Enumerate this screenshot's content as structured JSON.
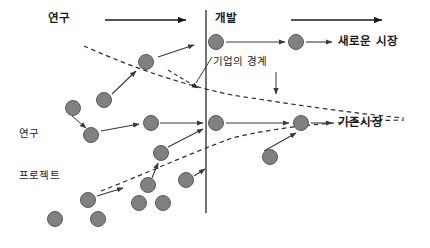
{
  "diagram": {
    "type": "process-flow",
    "canvas": {
      "width": 430,
      "height": 248,
      "background": "#ffffff"
    },
    "colors": {
      "node_fill": "#808080",
      "node_stroke": "#5a5a5a",
      "line": "#3a3a3a",
      "dashed": "#2b2b2b",
      "text": "#1a1a1a",
      "boundary_line": "#3a3a3a"
    }
  },
  "labels": {
    "stage_research": "연구",
    "stage_development": "개발",
    "boundary": "기업의 경계",
    "project_line1": "연구",
    "project_line2": "프로젝트",
    "market_new": "새로운 시장",
    "market_existing": "기존시장"
  },
  "label_positions": {
    "stage_research": {
      "x": 48,
      "y": 13
    },
    "stage_development": {
      "x": 215,
      "y": 13
    },
    "boundary": {
      "x": 213,
      "y": 62
    },
    "project": {
      "x": 19,
      "y": 100
    },
    "market_new": {
      "x": 338,
      "y": 36
    },
    "market_existing": {
      "x": 338,
      "y": 111
    }
  },
  "boundary_line": {
    "x": 206,
    "y1": 10,
    "y2": 213
  },
  "stage_arrows": [
    {
      "name": "research-arrow",
      "x1": 105,
      "y1": 20,
      "x2": 188,
      "y2": 20
    },
    {
      "name": "development-arrow",
      "x1": 291,
      "y1": 20,
      "x2": 384,
      "y2": 20
    }
  ],
  "dashed_curves": [
    {
      "name": "upper-boundary-curve",
      "path": "M 84 46 C 120 62, 170 82, 232 95 C 290 104, 350 113, 404 118"
    },
    {
      "name": "lower-boundary-curve",
      "path": "M 101 191 C 140 176, 186 155, 232 138 C 290 124, 352 121, 404 120"
    }
  ],
  "boundary_pointer": {
    "name": "boundary-callout-arrow",
    "x1": 276,
    "y1": 72,
    "x2": 276,
    "y2": 96
  },
  "boundary_leader": {
    "name": "boundary-leader-line",
    "x1": 212,
    "y1": 57,
    "x2": 196,
    "y2": 83
  },
  "nodes": [
    {
      "id": "n1",
      "name": "project-node-upper-mid",
      "cx": 146,
      "cy": 62,
      "r": 7.5
    },
    {
      "id": "n2",
      "name": "project-node-left-upper",
      "cx": 104,
      "cy": 100,
      "r": 7.5
    },
    {
      "id": "n3",
      "name": "project-node-left-mid",
      "cx": 73,
      "cy": 108,
      "r": 7.5
    },
    {
      "id": "n4",
      "name": "project-node-left-lower",
      "cx": 91,
      "cy": 135,
      "r": 7.5
    },
    {
      "id": "n5",
      "name": "project-node-center-row",
      "cx": 151,
      "cy": 123,
      "r": 7.5
    },
    {
      "id": "n6",
      "name": "project-node-boundary-upper",
      "cx": 216,
      "cy": 123,
      "r": 7.5
    },
    {
      "id": "n7",
      "name": "market-node-existing",
      "cx": 301,
      "cy": 123,
      "r": 7.5
    },
    {
      "id": "n8",
      "name": "project-node-dev-top",
      "cx": 216,
      "cy": 42,
      "r": 7.5
    },
    {
      "id": "n9",
      "name": "market-node-new",
      "cx": 296,
      "cy": 42,
      "r": 7.5
    },
    {
      "id": "n10",
      "name": "project-node-below-boundary",
      "cx": 270,
      "cy": 157,
      "r": 7.5
    },
    {
      "id": "n11",
      "name": "project-node-funnel-mid",
      "cx": 161,
      "cy": 153,
      "r": 7.5
    },
    {
      "id": "n12",
      "name": "project-node-lower-a",
      "cx": 148,
      "cy": 185,
      "r": 7.5
    },
    {
      "id": "n13",
      "name": "project-node-lower-b",
      "cx": 186,
      "cy": 180,
      "r": 7.5
    },
    {
      "id": "n14",
      "name": "project-node-lower-c",
      "cx": 139,
      "cy": 203,
      "r": 7.5
    },
    {
      "id": "n15",
      "name": "project-node-lower-d",
      "cx": 163,
      "cy": 203,
      "r": 7.5
    },
    {
      "id": "n16",
      "name": "project-node-bottom-left",
      "cx": 88,
      "cy": 200,
      "r": 7.5
    },
    {
      "id": "n17",
      "name": "project-node-bottom-a",
      "cx": 55,
      "cy": 219,
      "r": 7.5
    },
    {
      "id": "n18",
      "name": "project-node-bottom-b",
      "cx": 98,
      "cy": 219,
      "r": 7.5
    }
  ],
  "connector_arrows": [
    {
      "name": "arrow-node1-to-boundary-up",
      "x1": 158,
      "y1": 57,
      "x2": 196,
      "y2": 45
    },
    {
      "name": "arrow-node2-to-node1",
      "x1": 113,
      "y1": 94,
      "x2": 137,
      "y2": 70
    },
    {
      "name": "arrow-node4-to-node5",
      "x1": 101,
      "y1": 131,
      "x2": 140,
      "y2": 124
    },
    {
      "name": "arrow-node5-to-node6",
      "x1": 160,
      "y1": 123,
      "x2": 205,
      "y2": 123
    },
    {
      "name": "arrow-node6-to-node7",
      "x1": 226,
      "y1": 123,
      "x2": 291,
      "y2": 123
    },
    {
      "name": "arrow-node7-to-market",
      "x1": 311,
      "y1": 123,
      "x2": 334,
      "y2": 123
    },
    {
      "name": "arrow-node8-to-node9",
      "x1": 226,
      "y1": 42,
      "x2": 287,
      "y2": 42
    },
    {
      "name": "arrow-node9-to-market",
      "x1": 306,
      "y1": 42,
      "x2": 334,
      "y2": 42
    },
    {
      "name": "arrow-node10-to-node7",
      "x1": 263,
      "y1": 150,
      "x2": 297,
      "y2": 132
    },
    {
      "name": "arrow-node11-to-boundary",
      "x1": 168,
      "y1": 147,
      "x2": 205,
      "y2": 130
    },
    {
      "name": "arrow-node12-to-node11",
      "x1": 152,
      "y1": 178,
      "x2": 159,
      "y2": 162
    },
    {
      "name": "arrow-node13-to-boundary",
      "x1": 194,
      "y1": 175,
      "x2": 206,
      "y2": 168
    },
    {
      "name": "arrow-node16-to-right",
      "x1": 97,
      "y1": 196,
      "x2": 125,
      "y2": 188
    },
    {
      "name": "arrow-project-label",
      "x1": 74,
      "y1": 117,
      "x2": 88,
      "y2": 128
    }
  ]
}
